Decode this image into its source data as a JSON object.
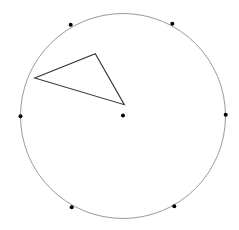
{
  "diagram": {
    "circle": {
      "cx": 123,
      "cy": 116,
      "r": 102.5,
      "stroke": "#9a9a9a"
    },
    "center_dot": {
      "x": 123,
      "y": 115.5
    },
    "perimeter_dots": [
      {
        "x": 70.7,
        "y": 24.7
      },
      {
        "x": 172.3,
        "y": 23.7
      },
      {
        "x": 20.5,
        "y": 116.3
      },
      {
        "x": 225.7,
        "y": 114.7
      },
      {
        "x": 71.7,
        "y": 207.3
      },
      {
        "x": 174.3,
        "y": 206.3
      }
    ],
    "triangle": {
      "points": [
        [
          34.7,
          78
        ],
        [
          95.3,
          53.7
        ],
        [
          124.3,
          104.7
        ]
      ],
      "stroke": "#333333"
    },
    "dot_color": "#000000"
  }
}
